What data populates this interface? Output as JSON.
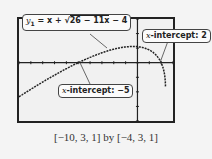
{
  "chart_data": {
    "type": "line",
    "title": "",
    "function": "y1 = x + sqrt(26 - 11x) - 4",
    "xlim": [
      -10,
      3
    ],
    "xscale": 1,
    "ylim": [
      -4,
      3
    ],
    "yscale": 1,
    "annotations": [
      {
        "label": "y1 = x + √(26 − 11x) − 4",
        "type": "equation"
      },
      {
        "label": "x-intercept: 2",
        "x": 2,
        "y": 0
      },
      {
        "label": "x-intercept: −5",
        "x": -5,
        "y": 0
      }
    ],
    "window_caption": "[−10, 3, 1] by [−4, 3, 1]",
    "grid": false
  },
  "labels": {
    "eq_lhs": "y",
    "eq_sub": "1",
    "eq_mid": " = x + √",
    "eq_rad": "26 − 11x",
    "eq_tail": " − 4",
    "int2_var": "x",
    "int2_text": "-intercept: 2",
    "int5_var": "x",
    "int5_text": "-intercept: −5",
    "caption": "[−10, 3, 1] by [−4, 3, 1]"
  }
}
